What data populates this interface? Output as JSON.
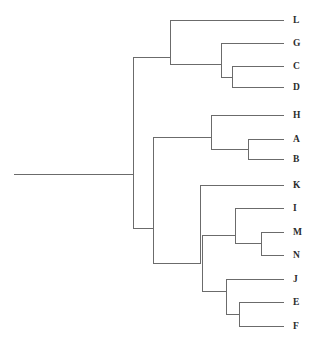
{
  "figure": {
    "title": "",
    "type": "dendrogram",
    "background_color": "#ffffff",
    "line_color": "#6b6b6b",
    "label_color": "#2b2b2b",
    "orientation": "horizontal-left-to-right"
  },
  "chart_data": {
    "type": "tree",
    "title": "",
    "xlabel": "",
    "ylabel": "",
    "orientation": "rectangular-horizontal",
    "grid": false,
    "legend": "none",
    "leaf_labels": [
      "L",
      "G",
      "C",
      "D",
      "H",
      "A",
      "B",
      "K",
      "I",
      "M",
      "N",
      "J",
      "E",
      "F"
    ],
    "leaves": [
      {
        "label": "L",
        "y": 20,
        "branch_x": 170,
        "tip_x": 284
      },
      {
        "label": "G",
        "y": 43,
        "branch_x": 221,
        "tip_x": 284
      },
      {
        "label": "C",
        "y": 66,
        "branch_x": 232,
        "tip_x": 284
      },
      {
        "label": "D",
        "y": 87,
        "branch_x": 232,
        "tip_x": 284
      },
      {
        "label": "H",
        "y": 115,
        "branch_x": 211,
        "tip_x": 284
      },
      {
        "label": "A",
        "y": 139,
        "branch_x": 248,
        "tip_x": 284
      },
      {
        "label": "B",
        "y": 159,
        "branch_x": 248,
        "tip_x": 284
      },
      {
        "label": "K",
        "y": 185,
        "branch_x": 200,
        "tip_x": 284
      },
      {
        "label": "I",
        "y": 208,
        "branch_x": 235,
        "tip_x": 284
      },
      {
        "label": "M",
        "y": 232,
        "branch_x": 261,
        "tip_x": 284
      },
      {
        "label": "N",
        "y": 255,
        "branch_x": 261,
        "tip_x": 284
      },
      {
        "label": "J",
        "y": 279,
        "branch_x": 226,
        "tip_x": 284
      },
      {
        "label": "E",
        "y": 302,
        "branch_x": 239,
        "tip_x": 284
      },
      {
        "label": "F",
        "y": 326,
        "branch_x": 239,
        "tip_x": 284
      }
    ],
    "internal_nodes": [
      {
        "id": "root",
        "x": 133,
        "y_top": 57,
        "y_bottom": 228,
        "members": [
          "L",
          "G",
          "C",
          "D",
          "H",
          "A",
          "B",
          "K",
          "I",
          "M",
          "N",
          "J",
          "E",
          "F"
        ]
      },
      {
        "id": "n_LGCD",
        "x": 170,
        "y_top": 20,
        "y_bottom": 64,
        "members": [
          "L",
          "G",
          "C",
          "D"
        ]
      },
      {
        "id": "n_GCD",
        "x": 221,
        "y_top": 43,
        "y_bottom": 77,
        "members": [
          "G",
          "C",
          "D"
        ]
      },
      {
        "id": "n_CD",
        "x": 232,
        "y_top": 66,
        "y_bottom": 87,
        "members": [
          "C",
          "D"
        ]
      },
      {
        "id": "n_lower",
        "x": 153,
        "y_top": 137,
        "y_bottom": 263,
        "members": [
          "H",
          "A",
          "B",
          "K",
          "I",
          "M",
          "N",
          "J",
          "E",
          "F"
        ]
      },
      {
        "id": "n_HAB",
        "x": 211,
        "y_top": 115,
        "y_bottom": 149,
        "members": [
          "H",
          "A",
          "B"
        ]
      },
      {
        "id": "n_AB",
        "x": 248,
        "y_top": 139,
        "y_bottom": 159,
        "members": [
          "A",
          "B"
        ]
      },
      {
        "id": "n_K_all",
        "x": 200,
        "y_top": 185,
        "y_bottom": 264,
        "members": [
          "K",
          "I",
          "M",
          "N",
          "J",
          "E",
          "F"
        ]
      },
      {
        "id": "n_IMN_J",
        "x": 202,
        "y_top": 235,
        "y_bottom": 291,
        "members": [
          "I",
          "M",
          "N",
          "J",
          "E",
          "F"
        ]
      },
      {
        "id": "n_IMN",
        "x": 235,
        "y_top": 208,
        "y_bottom": 243,
        "members": [
          "I",
          "M",
          "N"
        ]
      },
      {
        "id": "n_MN",
        "x": 261,
        "y_top": 232,
        "y_bottom": 255,
        "members": [
          "M",
          "N"
        ]
      },
      {
        "id": "n_JEF",
        "x": 226,
        "y_top": 279,
        "y_bottom": 314,
        "members": [
          "J",
          "E",
          "F"
        ]
      },
      {
        "id": "n_EF",
        "x": 239,
        "y_top": 302,
        "y_bottom": 326,
        "members": [
          "E",
          "F"
        ]
      }
    ],
    "connectors": [
      {
        "from": "root-stem",
        "x1": 14,
        "y1": 174,
        "x2": 133,
        "y2": 174
      },
      {
        "from": "root",
        "to": "n_LGCD",
        "x1": 133,
        "y1": 57,
        "x2": 170,
        "y2": 57
      },
      {
        "from": "root",
        "to": "n_lower",
        "x1": 133,
        "y1": 228,
        "x2": 153,
        "y2": 228
      },
      {
        "from": "n_LGCD",
        "to": "L",
        "x1": 170,
        "y1": 20,
        "x2": 284,
        "y2": 20
      },
      {
        "from": "n_LGCD",
        "to": "n_GCD",
        "x1": 170,
        "y1": 64,
        "x2": 221,
        "y2": 64
      },
      {
        "from": "n_GCD",
        "to": "G",
        "x1": 221,
        "y1": 43,
        "x2": 284,
        "y2": 43
      },
      {
        "from": "n_GCD",
        "to": "n_CD",
        "x1": 221,
        "y1": 77,
        "x2": 232,
        "y2": 77
      },
      {
        "from": "n_CD",
        "to": "C",
        "x1": 232,
        "y1": 66,
        "x2": 284,
        "y2": 66
      },
      {
        "from": "n_CD",
        "to": "D",
        "x1": 232,
        "y1": 87,
        "x2": 284,
        "y2": 87
      },
      {
        "from": "n_lower",
        "to": "n_HAB",
        "x1": 153,
        "y1": 137,
        "x2": 211,
        "y2": 137
      },
      {
        "from": "n_HAB",
        "to": "H",
        "x1": 211,
        "y1": 115,
        "x2": 284,
        "y2": 115
      },
      {
        "from": "n_HAB",
        "to": "n_AB",
        "x1": 211,
        "y1": 149,
        "x2": 248,
        "y2": 149
      },
      {
        "from": "n_AB",
        "to": "A",
        "x1": 248,
        "y1": 139,
        "x2": 284,
        "y2": 139
      },
      {
        "from": "n_AB",
        "to": "B",
        "x1": 248,
        "y1": 159,
        "x2": 284,
        "y2": 159
      },
      {
        "from": "n_lower",
        "to": "n_K_all",
        "x1": 153,
        "y1": 263,
        "x2": 200,
        "y2": 263
      },
      {
        "from": "n_K_all",
        "to": "K",
        "x1": 200,
        "y1": 185,
        "x2": 284,
        "y2": 185
      },
      {
        "from": "n_IMN_J",
        "to": "n_IMN",
        "x1": 202,
        "y1": 235,
        "x2": 235,
        "y2": 235
      },
      {
        "from": "n_IMN",
        "to": "I",
        "x1": 235,
        "y1": 208,
        "x2": 284,
        "y2": 208
      },
      {
        "from": "n_IMN",
        "to": "n_MN",
        "x1": 235,
        "y1": 243,
        "x2": 261,
        "y2": 243
      },
      {
        "from": "n_MN",
        "to": "M",
        "x1": 261,
        "y1": 232,
        "x2": 284,
        "y2": 232
      },
      {
        "from": "n_MN",
        "to": "N",
        "x1": 261,
        "y1": 255,
        "x2": 284,
        "y2": 255
      },
      {
        "from": "n_IMN_J",
        "to": "n_JEF",
        "x1": 202,
        "y1": 291,
        "x2": 226,
        "y2": 291
      },
      {
        "from": "n_JEF",
        "to": "J",
        "x1": 226,
        "y1": 279,
        "x2": 284,
        "y2": 279
      },
      {
        "from": "n_JEF",
        "to": "n_EF",
        "x1": 226,
        "y1": 314,
        "x2": 239,
        "y2": 314
      },
      {
        "from": "n_EF",
        "to": "E",
        "x1": 239,
        "y1": 302,
        "x2": 284,
        "y2": 302
      },
      {
        "from": "n_EF",
        "to": "F",
        "x1": 239,
        "y1": 326,
        "x2": 284,
        "y2": 326
      }
    ]
  }
}
